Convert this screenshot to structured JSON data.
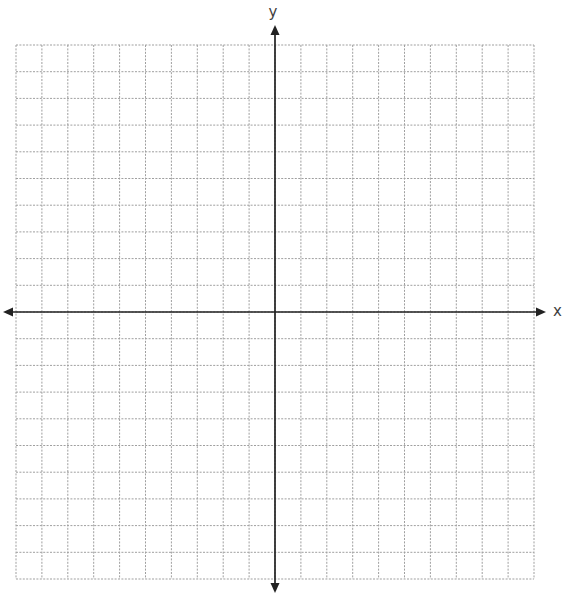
{
  "page": {
    "background": "#ffffff"
  },
  "chart_data": {
    "type": "scatter",
    "title": "",
    "xlabel": "x",
    "ylabel": "y",
    "x_range": [
      -10,
      10
    ],
    "y_range": [
      -10,
      10
    ],
    "grid": true,
    "grid_columns": 20,
    "grid_rows": 20,
    "tick_labels_shown": false,
    "series": [],
    "annotations": [],
    "legend_position": "none",
    "colors": {
      "grid_line": "#9f9f9f",
      "axis": "#222222",
      "label": "#3f3f3f",
      "background": "#ffffff"
    }
  }
}
